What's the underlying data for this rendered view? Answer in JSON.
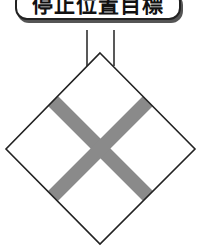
{
  "label": {
    "text": "停止位置目標"
  },
  "sign": {
    "shape": "diamond",
    "symbol": "x-cross",
    "fill_color": "#ffffff",
    "outline_color": "#222222",
    "cross_color": "#8a8a8a",
    "post_color": "#222222"
  }
}
